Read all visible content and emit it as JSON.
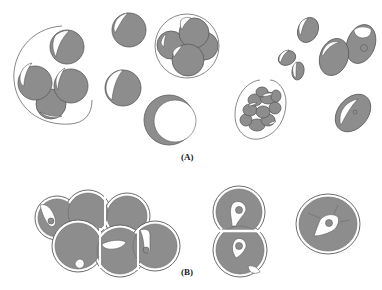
{
  "figure": {
    "panels": [
      {
        "id": "A",
        "label": "(A)",
        "description": "Spherical and ovoid cells, individually and in clusters within envelopes"
      },
      {
        "id": "B",
        "label": "(B)",
        "description": "Cross-sections of multi-celled aggregates with inner lumens and nuclei"
      }
    ],
    "colors": {
      "cell_fill": "#8d8d8d",
      "outline": "#5a5a5a",
      "background": "#ffffff"
    }
  }
}
